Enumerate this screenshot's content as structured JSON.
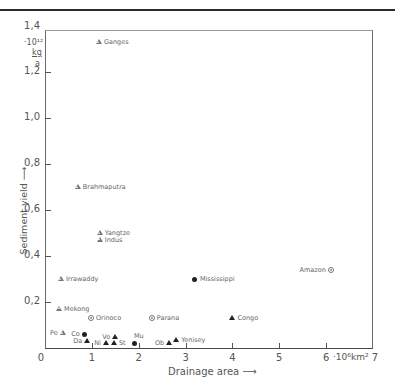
{
  "chart_data": {
    "type": "scatter",
    "title": "",
    "xlabel": "Drainage area",
    "xunit": "·10^6 km²",
    "ylabel": "Sediment yield",
    "yunit": "·10^12 kg/a",
    "xlim": [
      0,
      7
    ],
    "ylim": [
      0,
      1.4
    ],
    "x_ticks": [
      "0",
      "1",
      "2",
      "3",
      "4",
      "5",
      "6",
      "7"
    ],
    "y_ticks": [
      "0,2",
      "0,4",
      "0,6",
      "0,8",
      "1,0",
      "1,2",
      "1,4"
    ],
    "grid": false,
    "legend": null,
    "points": [
      {
        "name": "Ganges",
        "x": 1.15,
        "y": 1.33,
        "marker": "triangle-open",
        "label_side": "right"
      },
      {
        "name": "Brahmaputra",
        "x": 0.7,
        "y": 0.7,
        "marker": "triangle-open",
        "label_side": "right"
      },
      {
        "name": "Yangtze",
        "x": 1.17,
        "y": 0.5,
        "marker": "triangle-open",
        "label_side": "right"
      },
      {
        "name": "Indus",
        "x": 1.17,
        "y": 0.47,
        "marker": "triangle-open",
        "label_side": "right"
      },
      {
        "name": "Irrawaddy",
        "x": 0.34,
        "y": 0.3,
        "marker": "triangle-open",
        "label_side": "right"
      },
      {
        "name": "Mekong",
        "x": 0.3,
        "y": 0.17,
        "marker": "triangle-open",
        "label_side": "right"
      },
      {
        "name": "Orinoco",
        "x": 0.98,
        "y": 0.13,
        "marker": "circle-open",
        "label_side": "right"
      },
      {
        "name": "Parana",
        "x": 2.28,
        "y": 0.13,
        "marker": "circle-open",
        "label_side": "right"
      },
      {
        "name": "Mississippi",
        "x": 3.2,
        "y": 0.3,
        "marker": "circle-filled",
        "label_side": "right"
      },
      {
        "name": "Amazon",
        "x": 6.1,
        "y": 0.34,
        "marker": "circle-open",
        "label_side": "left"
      },
      {
        "name": "Congo",
        "x": 4.0,
        "y": 0.13,
        "marker": "triangle-filled",
        "label_side": "right"
      },
      {
        "name": "Pe",
        "x": 0.38,
        "y": 0.065,
        "marker": "triangle-open",
        "label_side": "left"
      },
      {
        "name": "Co",
        "x": 0.85,
        "y": 0.06,
        "marker": "circle-filled",
        "label_side": "left"
      },
      {
        "name": "Da",
        "x": 0.9,
        "y": 0.03,
        "marker": "triangle-filled",
        "label_side": "left"
      },
      {
        "name": "Ni",
        "x": 1.3,
        "y": 0.02,
        "marker": "triangle-filled",
        "label_side": "left"
      },
      {
        "name": "Vo",
        "x": 1.5,
        "y": 0.05,
        "marker": "triangle-filled",
        "label_side": "left"
      },
      {
        "name": "St",
        "x": 1.47,
        "y": 0.02,
        "marker": "triangle-filled",
        "label_side": "right"
      },
      {
        "name": "Mu",
        "x": 1.9,
        "y": 0.02,
        "marker": "circle-filled",
        "label_side": "right-up"
      },
      {
        "name": "Ob",
        "x": 2.65,
        "y": 0.02,
        "marker": "triangle-filled",
        "label_side": "left"
      },
      {
        "name": "Yenisey",
        "x": 2.8,
        "y": 0.035,
        "marker": "triangle-filled",
        "label_side": "right"
      }
    ]
  },
  "axes": {
    "y_title": "Sediment yield",
    "y_arrow": "⟶",
    "y_unit_exp": "·10¹²",
    "y_unit_num": "kg",
    "y_unit_den": "a",
    "x_title": "Drainage area",
    "x_arrow": "⟶",
    "x_unit": "·10⁶km²"
  }
}
